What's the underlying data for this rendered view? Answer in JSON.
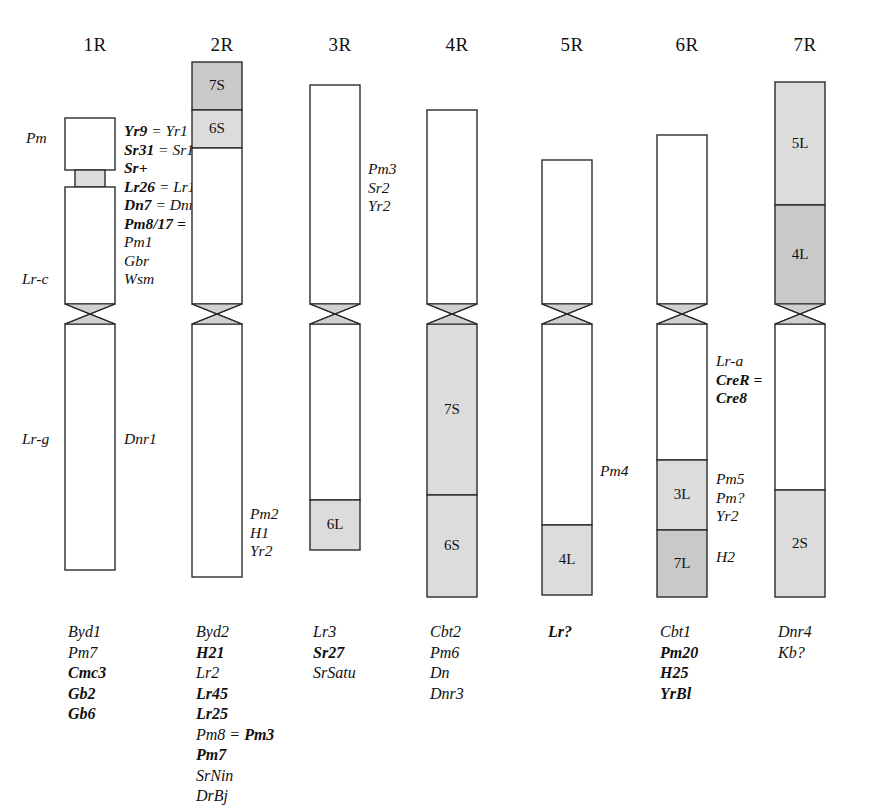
{
  "figure": {
    "type": "chromosome-ideogram",
    "organism_genome": "R",
    "background_color": "#ffffff",
    "outline_color": "#2b2b2b",
    "band_fill_light": "#dcdcdc",
    "band_fill_dark": "#c9c9c9",
    "centromere_fill": "#d0d0d0"
  },
  "chromosomes": [
    {
      "id": "1R",
      "title": "1R",
      "title_x": 70,
      "title_y": 34,
      "body_x": 65,
      "body_width": 50,
      "segments": [
        {
          "name": "1R-short-top",
          "y": 118,
          "height": 52,
          "fill": "white",
          "label": "",
          "width": 50,
          "x_offset": 0
        },
        {
          "name": "1R-gray-band",
          "y": 170,
          "height": 17,
          "fill": "light",
          "label": "",
          "width": 30,
          "x_offset": 10
        },
        {
          "name": "1R-short-lower",
          "y": 187,
          "height": 117,
          "fill": "white",
          "label": "",
          "width": 50,
          "x_offset": 0
        },
        {
          "name": "1R-long-arm",
          "y": 324,
          "height": 246,
          "fill": "white",
          "label": "",
          "width": 50,
          "x_offset": 0
        }
      ],
      "centromere": {
        "y": 304,
        "height": 20
      },
      "left_labels": [
        {
          "name": "label-pm",
          "text": "Pm",
          "x": 26,
          "y": 129,
          "bold": false
        },
        {
          "name": "label-lr-c",
          "text": "Lr-c",
          "x": 22,
          "y": 270,
          "bold": false
        },
        {
          "name": "label-lr-g",
          "text": "Lr-g",
          "x": 22,
          "y": 430,
          "bold": false
        }
      ],
      "right_labels": [
        {
          "name": "label-dnr1",
          "text": "Dnr1",
          "x": 124,
          "y": 430,
          "bold": false
        }
      ],
      "gene_annotation": {
        "x": 124,
        "y": 122,
        "lines": [
          [
            {
              "t": "Yr9",
              "b": true
            },
            {
              "t": " = ",
              "b": false
            },
            {
              "t": "Yr1",
              "b": false
            }
          ],
          [
            {
              "t": "Sr31",
              "b": true
            },
            {
              "t": " = ",
              "b": false
            },
            {
              "t": "Sr1",
              "b": false
            }
          ],
          [
            {
              "t": "Sr+",
              "b": true
            }
          ],
          [
            {
              "t": "Lr26",
              "b": true
            },
            {
              "t": " = ",
              "b": false
            },
            {
              "t": "Lr1",
              "b": false
            }
          ],
          [
            {
              "t": "Dn7",
              "b": true
            },
            {
              "t": " = ",
              "b": false
            },
            {
              "t": "Dnr",
              "b": false
            }
          ],
          [
            {
              "t": "Pm8/17",
              "b": true
            },
            {
              "t": " =",
              "b": true
            }
          ],
          [
            {
              "t": "Pm1",
              "b": false
            }
          ],
          [
            {
              "t": "Gbr",
              "b": false
            }
          ],
          [
            {
              "t": "Wsm",
              "b": false
            }
          ]
        ]
      },
      "bottom_genes": {
        "x": 68,
        "y": 622,
        "lines": [
          [
            {
              "t": "Byd1",
              "b": false
            }
          ],
          [
            {
              "t": "Pm7",
              "b": false
            }
          ],
          [
            {
              "t": "Cmc3",
              "b": true
            }
          ],
          [
            {
              "t": "Gb2",
              "b": true
            }
          ],
          [
            {
              "t": "Gb6",
              "b": true
            }
          ]
        ]
      }
    },
    {
      "id": "2R",
      "title": "2R",
      "title_x": 197,
      "title_y": 34,
      "body_x": 192,
      "body_width": 50,
      "segments": [
        {
          "name": "2R-band-7S",
          "y": 62,
          "height": 48,
          "fill": "dark",
          "label": "7S",
          "width": 50,
          "x_offset": 0
        },
        {
          "name": "2R-band-6S",
          "y": 110,
          "height": 38,
          "fill": "light",
          "label": "6S",
          "width": 50,
          "x_offset": 0
        },
        {
          "name": "2R-short-white",
          "y": 148,
          "height": 156,
          "fill": "white",
          "label": "",
          "width": 50,
          "x_offset": 0
        },
        {
          "name": "2R-long-arm",
          "y": 324,
          "height": 253,
          "fill": "white",
          "label": "",
          "width": 50,
          "x_offset": 0
        }
      ],
      "centromere": {
        "y": 304,
        "height": 20
      },
      "left_labels": [],
      "right_labels": [],
      "gene_annotation": null,
      "side_genes": {
        "x": 250,
        "y": 505,
        "lines": [
          [
            {
              "t": "Pm2",
              "b": false
            }
          ],
          [
            {
              "t": "H1",
              "b": false
            }
          ],
          [
            {
              "t": "Yr2",
              "b": false
            }
          ]
        ]
      },
      "bottom_genes": {
        "x": 196,
        "y": 622,
        "lines": [
          [
            {
              "t": "Byd2",
              "b": false
            }
          ],
          [
            {
              "t": "H21",
              "b": true
            }
          ],
          [
            {
              "t": "Lr2",
              "b": false
            }
          ],
          [
            {
              "t": "Lr45",
              "b": true
            }
          ],
          [
            {
              "t": "Lr25",
              "b": true
            }
          ],
          [
            {
              "t": "Pm8",
              "b": false
            },
            {
              "t": " = ",
              "b": false
            },
            {
              "t": "Pm3",
              "b": true
            }
          ],
          [
            {
              "t": "Pm7",
              "b": true
            }
          ],
          [
            {
              "t": "SrNin",
              "b": false
            }
          ],
          [
            {
              "t": "DrBj",
              "b": false
            }
          ]
        ]
      }
    },
    {
      "id": "3R",
      "title": "3R",
      "title_x": 315,
      "title_y": 34,
      "body_x": 310,
      "body_width": 50,
      "segments": [
        {
          "name": "3R-short-arm",
          "y": 85,
          "height": 219,
          "fill": "white",
          "label": "",
          "width": 50,
          "x_offset": 0
        },
        {
          "name": "3R-long-white",
          "y": 324,
          "height": 176,
          "fill": "white",
          "label": "",
          "width": 50,
          "x_offset": 0
        },
        {
          "name": "3R-band-6L",
          "y": 500,
          "height": 50,
          "fill": "light",
          "label": "6L",
          "width": 50,
          "x_offset": 0
        }
      ],
      "centromere": {
        "y": 304,
        "height": 20
      },
      "left_labels": [],
      "right_labels": [],
      "gene_annotation": {
        "x": 368,
        "y": 160,
        "lines": [
          [
            {
              "t": "Pm3",
              "b": false
            }
          ],
          [
            {
              "t": "Sr2",
              "b": false
            }
          ],
          [
            {
              "t": "Yr2",
              "b": false
            }
          ]
        ]
      },
      "bottom_genes": {
        "x": 313,
        "y": 622,
        "lines": [
          [
            {
              "t": "Lr3",
              "b": false
            }
          ],
          [
            {
              "t": "Sr27",
              "b": true
            }
          ],
          [
            {
              "t": "SrSatu",
              "b": false
            }
          ]
        ]
      }
    },
    {
      "id": "4R",
      "title": "4R",
      "title_x": 432,
      "title_y": 34,
      "body_x": 427,
      "body_width": 50,
      "segments": [
        {
          "name": "4R-short-arm",
          "y": 110,
          "height": 194,
          "fill": "white",
          "label": "",
          "width": 50,
          "x_offset": 0
        },
        {
          "name": "4R-band-7S",
          "y": 324,
          "height": 171,
          "fill": "light",
          "label": "7S",
          "width": 50,
          "x_offset": 0
        },
        {
          "name": "4R-band-6S",
          "y": 495,
          "height": 102,
          "fill": "light",
          "label": "6S",
          "width": 50,
          "x_offset": 0
        }
      ],
      "centromere": {
        "y": 304,
        "height": 20
      },
      "left_labels": [],
      "right_labels": [],
      "gene_annotation": null,
      "bottom_genes": {
        "x": 430,
        "y": 622,
        "lines": [
          [
            {
              "t": "Cbt2",
              "b": false
            }
          ],
          [
            {
              "t": "Pm6",
              "b": false
            }
          ],
          [
            {
              "t": "Dn",
              "b": false
            }
          ],
          [
            {
              "t": "Dnr3",
              "b": false
            }
          ]
        ]
      }
    },
    {
      "id": "5R",
      "title": "5R",
      "title_x": 547,
      "title_y": 34,
      "body_x": 542,
      "body_width": 50,
      "segments": [
        {
          "name": "5R-short-arm",
          "y": 160,
          "height": 144,
          "fill": "white",
          "label": "",
          "width": 50,
          "x_offset": 0
        },
        {
          "name": "5R-long-white",
          "y": 324,
          "height": 201,
          "fill": "white",
          "label": "",
          "width": 50,
          "x_offset": 0
        },
        {
          "name": "5R-band-4L",
          "y": 525,
          "height": 70,
          "fill": "light",
          "label": "4L",
          "width": 50,
          "x_offset": 0
        }
      ],
      "centromere": {
        "y": 304,
        "height": 20
      },
      "left_labels": [],
      "right_labels": [
        {
          "name": "label-pm4",
          "text": "Pm4",
          "x": 600,
          "y": 462,
          "bold": false
        }
      ],
      "gene_annotation": null,
      "bottom_genes": {
        "x": 548,
        "y": 622,
        "lines": [
          [
            {
              "t": "Lr?",
              "b": true
            }
          ]
        ]
      }
    },
    {
      "id": "6R",
      "title": "6R",
      "title_x": 662,
      "title_y": 34,
      "body_x": 657,
      "body_width": 50,
      "segments": [
        {
          "name": "6R-short-arm",
          "y": 135,
          "height": 169,
          "fill": "white",
          "label": "",
          "width": 50,
          "x_offset": 0
        },
        {
          "name": "6R-long-white",
          "y": 324,
          "height": 136,
          "fill": "white",
          "label": "",
          "width": 50,
          "x_offset": 0
        },
        {
          "name": "6R-band-3L",
          "y": 460,
          "height": 70,
          "fill": "light",
          "label": "3L",
          "width": 50,
          "x_offset": 0
        },
        {
          "name": "6R-band-7L",
          "y": 530,
          "height": 67,
          "fill": "dark",
          "label": "7L",
          "width": 50,
          "x_offset": 0
        }
      ],
      "centromere": {
        "y": 304,
        "height": 20
      },
      "left_labels": [],
      "right_labels": [],
      "gene_annotation": {
        "x": 716,
        "y": 352,
        "lines": [
          [
            {
              "t": "Lr-a",
              "b": false
            }
          ],
          [
            {
              "t": "CreR",
              "b": true
            },
            {
              "t": " =",
              "b": true
            }
          ],
          [
            {
              "t": "Cre8",
              "b": true
            }
          ]
        ]
      },
      "gene_annotation_2": {
        "x": 716,
        "y": 470,
        "lines": [
          [
            {
              "t": "Pm5",
              "b": false
            }
          ],
          [
            {
              "t": "Pm?",
              "b": false
            }
          ],
          [
            {
              "t": "Yr2",
              "b": false
            }
          ]
        ]
      },
      "gene_annotation_3": {
        "x": 716,
        "y": 548,
        "lines": [
          [
            {
              "t": "H2",
              "b": false
            }
          ]
        ]
      },
      "bottom_genes": {
        "x": 660,
        "y": 622,
        "lines": [
          [
            {
              "t": "Cbt1",
              "b": false
            }
          ],
          [
            {
              "t": "Pm20",
              "b": true
            }
          ],
          [
            {
              "t": "H25",
              "b": true
            }
          ],
          [
            {
              "t": "YrBl",
              "b": true
            }
          ]
        ]
      }
    },
    {
      "id": "7R",
      "title": "7R",
      "title_x": 780,
      "title_y": 34,
      "body_x": 775,
      "body_width": 50,
      "segments": [
        {
          "name": "7R-band-5L",
          "y": 82,
          "height": 123,
          "fill": "light",
          "label": "5L",
          "width": 50,
          "x_offset": 0
        },
        {
          "name": "7R-band-4L",
          "y": 205,
          "height": 99,
          "fill": "dark",
          "label": "4L",
          "width": 50,
          "x_offset": 0
        },
        {
          "name": "7R-long-white",
          "y": 324,
          "height": 166,
          "fill": "white",
          "label": "",
          "width": 50,
          "x_offset": 0
        },
        {
          "name": "7R-band-2S",
          "y": 490,
          "height": 107,
          "fill": "light",
          "label": "2S",
          "width": 50,
          "x_offset": 0
        }
      ],
      "centromere": {
        "y": 304,
        "height": 20
      },
      "left_labels": [],
      "right_labels": [],
      "gene_annotation": null,
      "bottom_genes": {
        "x": 778,
        "y": 622,
        "lines": [
          [
            {
              "t": "Dnr4",
              "b": false
            }
          ],
          [
            {
              "t": "Kb?",
              "b": false
            }
          ]
        ]
      }
    }
  ]
}
